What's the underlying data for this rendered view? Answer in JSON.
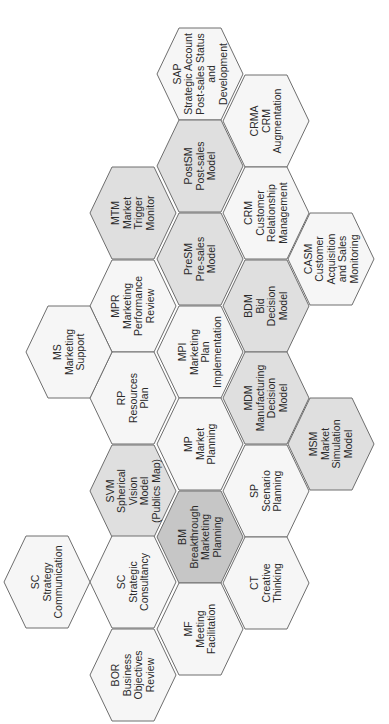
{
  "diagram": {
    "type": "hexagonal-module-map",
    "orientation": "text rotated 90deg counter-clockwise",
    "colors": {
      "light": "#f6f6f6",
      "mid": "#dfdfdf",
      "dark": "#c6c6c6",
      "border": "#6e6e6e",
      "text": "#2a2a2a"
    },
    "hexagons": [
      {
        "id": "sap",
        "cx": 200,
        "cy": 74,
        "shade": "light",
        "lines": [
          "SAP",
          "Strategic Account",
          "Post-sales Status",
          "and",
          "Development"
        ]
      },
      {
        "id": "postsm",
        "cx": 200,
        "cy": 166,
        "shade": "mid",
        "lines": [
          "PostSM",
          "Post-sales",
          "Model"
        ]
      },
      {
        "id": "presm",
        "cx": 200,
        "cy": 259,
        "shade": "mid",
        "lines": [
          "PreSM",
          "Pre-sales",
          "Model"
        ]
      },
      {
        "id": "mpi",
        "cx": 200,
        "cy": 352,
        "shade": "light",
        "lines": [
          "MPI",
          "Marketing",
          "Plan",
          "Implementation"
        ]
      },
      {
        "id": "mp",
        "cx": 200,
        "cy": 444,
        "shade": "light",
        "lines": [
          "MP",
          "Market",
          "Planning"
        ]
      },
      {
        "id": "bm",
        "cx": 200,
        "cy": 537,
        "shade": "dark",
        "lines": [
          "BM",
          "Breakthrough",
          "Marketing",
          "Planning"
        ]
      },
      {
        "id": "mf",
        "cx": 200,
        "cy": 629,
        "shade": "light",
        "lines": [
          "MF",
          "Meeting",
          "Facilitation"
        ]
      },
      {
        "id": "mtm",
        "cx": 133,
        "cy": 213,
        "shade": "mid",
        "lines": [
          "MTM",
          "Market",
          "Trigger",
          "Monitor"
        ]
      },
      {
        "id": "mpr",
        "cx": 133,
        "cy": 306,
        "shade": "light",
        "lines": [
          "MPR",
          "Marketing",
          "Performance",
          "Review"
        ]
      },
      {
        "id": "rp",
        "cx": 133,
        "cy": 398,
        "shade": "light",
        "lines": [
          "RP",
          "Resources",
          "Plan"
        ]
      },
      {
        "id": "svm",
        "cx": 133,
        "cy": 491,
        "shade": "mid",
        "lines": [
          "SVM",
          "Spherical",
          "Vision",
          "Model",
          "(Publics Map)"
        ]
      },
      {
        "id": "sc-consult",
        "cx": 133,
        "cy": 582,
        "shade": "light",
        "lines": [
          "SC",
          "Strategic",
          "Consultancy"
        ]
      },
      {
        "id": "bor",
        "cx": 133,
        "cy": 675,
        "shade": "light",
        "lines": [
          "BOR",
          "Business",
          "Objectives",
          "Review"
        ]
      },
      {
        "id": "crma",
        "cx": 266,
        "cy": 121,
        "shade": "light",
        "lines": [
          "CRMA",
          "CRM",
          "Augmentation"
        ]
      },
      {
        "id": "crm",
        "cx": 266,
        "cy": 213,
        "shade": "light",
        "lines": [
          "CRM",
          "Customer",
          "Relationship",
          "Management"
        ]
      },
      {
        "id": "bdm",
        "cx": 266,
        "cy": 306,
        "shade": "mid",
        "lines": [
          "BDM",
          "Bid",
          "Decision",
          "Model"
        ]
      },
      {
        "id": "mdm",
        "cx": 266,
        "cy": 398,
        "shade": "mid",
        "lines": [
          "MDM",
          "Manufacturing",
          "Decision",
          "Model"
        ]
      },
      {
        "id": "sp",
        "cx": 266,
        "cy": 491,
        "shade": "light",
        "lines": [
          "SP",
          "Scenario",
          "Planning"
        ]
      },
      {
        "id": "ct",
        "cx": 266,
        "cy": 583,
        "shade": "light",
        "lines": [
          "CT",
          "Creative",
          "Thinking"
        ]
      },
      {
        "id": "casm",
        "cx": 331,
        "cy": 259,
        "shade": "light",
        "lines": [
          "CASM",
          "Customer",
          "Acquisition",
          "and Sales",
          "Monitoring"
        ]
      },
      {
        "id": "msm",
        "cx": 331,
        "cy": 444,
        "shade": "mid",
        "lines": [
          "MSM",
          "Market",
          "Simulation",
          "Model"
        ]
      },
      {
        "id": "ms",
        "cx": 69,
        "cy": 352,
        "shade": "light",
        "lines": [
          "MS",
          "Marketing",
          "Support"
        ]
      },
      {
        "id": "sc-comm",
        "cx": 47,
        "cy": 582,
        "shade": "light",
        "lines": [
          "SC",
          "Strategy",
          "Communication"
        ]
      }
    ]
  }
}
